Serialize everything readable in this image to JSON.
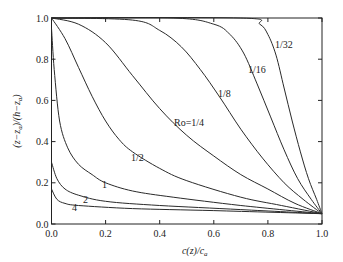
{
  "chart_data": {
    "type": "line",
    "title": "",
    "xlabel": "c(z)/c_a",
    "ylabel": "(z−z_a)/(h−z_a)",
    "xlim": [
      0,
      1
    ],
    "ylim": [
      0,
      1
    ],
    "xticks": [
      "0.0",
      "0.2",
      "0.4",
      "0.6",
      "0.8",
      "1.0"
    ],
    "yticks": [
      "0.0",
      "0.2",
      "0.4",
      "0.6",
      "0.8",
      "1.0"
    ],
    "grid": false,
    "legend": "inline labels",
    "series": [
      {
        "name": "4",
        "label": "4",
        "points": [
          [
            0,
            0.17
          ],
          [
            0.02,
            0.12
          ],
          [
            0.05,
            0.1
          ],
          [
            0.1,
            0.09
          ],
          [
            0.3,
            0.075
          ],
          [
            0.6,
            0.065
          ],
          [
            1,
            0.05
          ]
        ]
      },
      {
        "name": "2",
        "label": "2",
        "points": [
          [
            0,
            0.3
          ],
          [
            0.02,
            0.22
          ],
          [
            0.05,
            0.17
          ],
          [
            0.1,
            0.14
          ],
          [
            0.2,
            0.11
          ],
          [
            0.4,
            0.09
          ],
          [
            0.7,
            0.07
          ],
          [
            1,
            0.05
          ]
        ]
      },
      {
        "name": "1",
        "label": "1",
        "points": [
          [
            0,
            0.95
          ],
          [
            0.01,
            0.75
          ],
          [
            0.03,
            0.5
          ],
          [
            0.06,
            0.37
          ],
          [
            0.1,
            0.29
          ],
          [
            0.15,
            0.24
          ],
          [
            0.2,
            0.2
          ],
          [
            0.3,
            0.16
          ],
          [
            0.45,
            0.13
          ],
          [
            0.7,
            0.09
          ],
          [
            1,
            0.05
          ]
        ]
      },
      {
        "name": "1/2",
        "label": "1/2",
        "points": [
          [
            0,
            1
          ],
          [
            0.05,
            0.9
          ],
          [
            0.1,
            0.76
          ],
          [
            0.15,
            0.62
          ],
          [
            0.2,
            0.5
          ],
          [
            0.25,
            0.41
          ],
          [
            0.3,
            0.35
          ],
          [
            0.4,
            0.27
          ],
          [
            0.5,
            0.21
          ],
          [
            0.7,
            0.13
          ],
          [
            0.85,
            0.09
          ],
          [
            1,
            0.05
          ]
        ]
      },
      {
        "name": "Ro=1/4",
        "label": "Ro=1/4",
        "points": [
          [
            0,
            1
          ],
          [
            0.1,
            0.97
          ],
          [
            0.2,
            0.88
          ],
          [
            0.3,
            0.72
          ],
          [
            0.4,
            0.56
          ],
          [
            0.5,
            0.43
          ],
          [
            0.6,
            0.33
          ],
          [
            0.7,
            0.24
          ],
          [
            0.8,
            0.17
          ],
          [
            0.9,
            0.1
          ],
          [
            1,
            0.05
          ]
        ]
      },
      {
        "name": "1/8",
        "label": "1/8",
        "points": [
          [
            0,
            1
          ],
          [
            0.3,
            0.99
          ],
          [
            0.4,
            0.94
          ],
          [
            0.48,
            0.86
          ],
          [
            0.55,
            0.75
          ],
          [
            0.62,
            0.62
          ],
          [
            0.7,
            0.46
          ],
          [
            0.78,
            0.32
          ],
          [
            0.86,
            0.2
          ],
          [
            0.93,
            0.12
          ],
          [
            1,
            0.05
          ]
        ]
      },
      {
        "name": "1/16",
        "label": "1/16",
        "points": [
          [
            0,
            1
          ],
          [
            0.45,
            1
          ],
          [
            0.6,
            0.97
          ],
          [
            0.66,
            0.92
          ],
          [
            0.71,
            0.83
          ],
          [
            0.76,
            0.68
          ],
          [
            0.81,
            0.52
          ],
          [
            0.86,
            0.36
          ],
          [
            0.91,
            0.22
          ],
          [
            0.96,
            0.12
          ],
          [
            1,
            0.05
          ]
        ]
      },
      {
        "name": "1/32",
        "label": "1/32",
        "points": [
          [
            0,
            1
          ],
          [
            0.7,
            1
          ],
          [
            0.77,
            0.97
          ],
          [
            0.8,
            0.92
          ],
          [
            0.83,
            0.82
          ],
          [
            0.86,
            0.66
          ],
          [
            0.89,
            0.5
          ],
          [
            0.92,
            0.35
          ],
          [
            0.95,
            0.22
          ],
          [
            0.98,
            0.12
          ],
          [
            1,
            0.05
          ]
        ]
      }
    ]
  },
  "labels": {
    "ro_4": "4",
    "ro_2": "2",
    "ro_1": "1",
    "ro_1_2": "1/2",
    "ro_1_4": "Ro=1/4",
    "ro_1_8": "1/8",
    "ro_1_16": "1/16",
    "ro_1_32": "1/32"
  }
}
